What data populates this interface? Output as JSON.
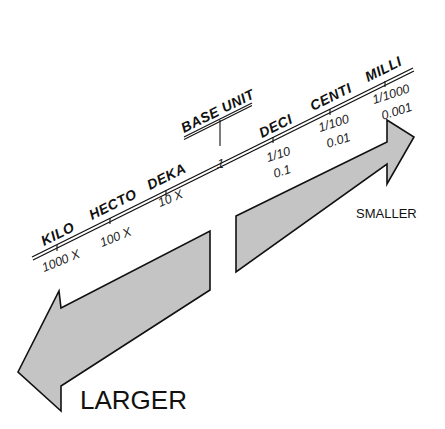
{
  "diagram": {
    "colors": {
      "arrow_fill": "#c4c4c4",
      "arrow_stroke": "#111111",
      "line": "#111111",
      "background": "#ffffff"
    },
    "scale": {
      "base_label": "BASE UNIT",
      "base_value": "1",
      "prefixes": [
        {
          "name": "KILO",
          "value": "1000 X"
        },
        {
          "name": "HECTO",
          "value": "100 X"
        },
        {
          "name": "DEKA",
          "value": "10 X"
        },
        {
          "name": "DECI",
          "fraction": "1/10",
          "decimal": "0.1"
        },
        {
          "name": "CENTI",
          "fraction": "1/100",
          "decimal": "0.01"
        },
        {
          "name": "MILLI",
          "fraction": "1/1000",
          "decimal": "0.001"
        }
      ]
    },
    "arrows": {
      "right": {
        "label": "SMALLER",
        "direction": "right"
      },
      "left": {
        "label": "LARGER",
        "direction": "left"
      }
    }
  }
}
